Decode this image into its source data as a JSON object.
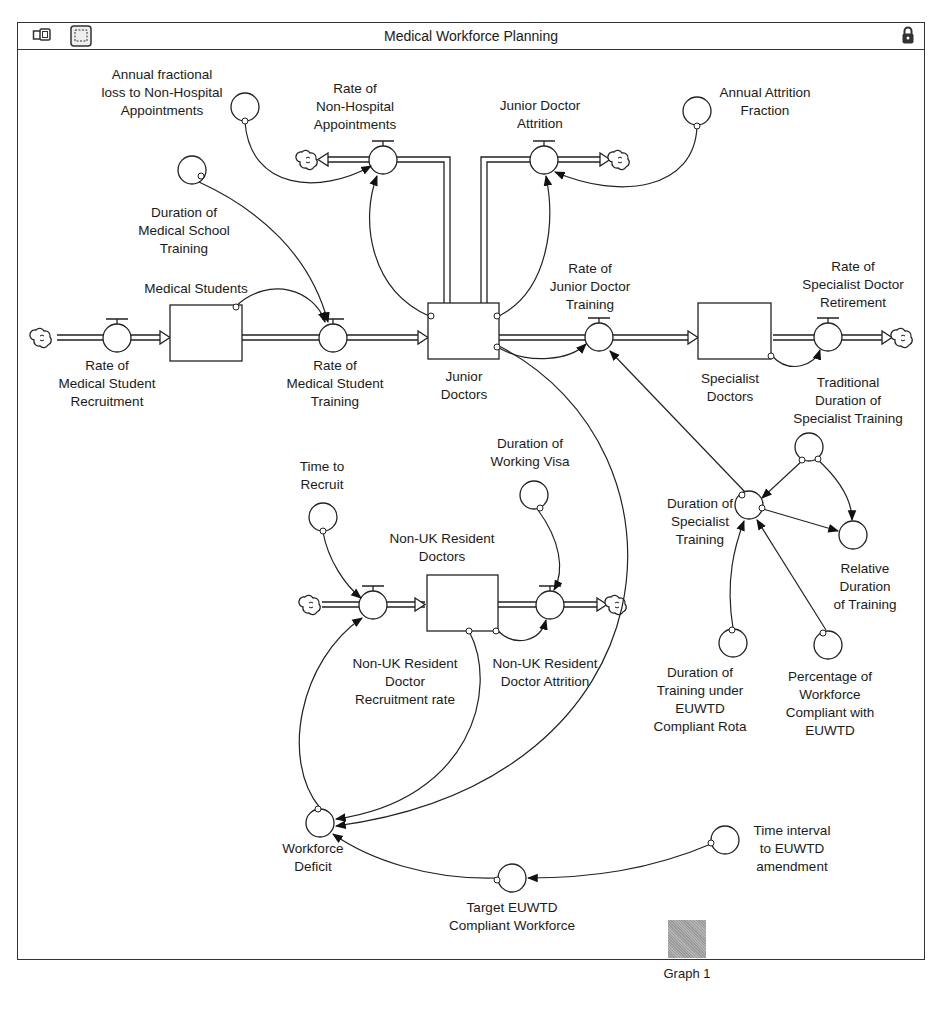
{
  "window": {
    "title": "Medical Workforce Planning",
    "icons": [
      "layers-icon",
      "selection-icon",
      "lock-icon"
    ]
  },
  "stocks": {
    "medical_students": "Medical Students",
    "junior_doctors": "Junior\nDoctors",
    "specialist_doctors": "Specialist\nDoctors",
    "non_uk_doctors": "Non-UK Resident\nDoctors"
  },
  "flows": {
    "med_student_recruitment": "Rate of\nMedical Student\nRecruitment",
    "med_student_training": "Rate of\nMedical Student\nTraining",
    "non_hospital_appointments": "Rate of\nNon-Hospital\nAppointments",
    "junior_attrition": "Junior Doctor\nAttrition",
    "junior_training": "Rate of\nJunior Doctor\nTraining",
    "specialist_retirement": "Rate of\nSpecialist Doctor\nRetirement",
    "non_uk_recruitment": "Non-UK Resident\nDoctor\nRecruitment rate",
    "non_uk_attrition": "Non-UK Resident\nDoctor Attrition"
  },
  "converters": {
    "annual_loss_non_hospital": "Annual fractional\nloss to Non-Hospital\nAppointments",
    "annual_attrition_fraction": "Annual Attrition\nFraction",
    "duration_med_school": "Duration of\nMedical School\nTraining",
    "traditional_duration": "Traditional\nDuration of\nSpecialist Training",
    "duration_specialist": "Duration of\nSpecialist\nTraining",
    "relative_duration": "Relative\nDuration\nof Training",
    "duration_euwtd_rota": "Duration of\nTraining under\nEUWTD\nCompliant Rota",
    "percentage_compliant": "Percentage of\nWorkforce\nCompliant with\nEUWTD",
    "time_to_recruit": "Time to\nRecruit",
    "duration_working_visa": "Duration of\nWorking Visa",
    "workforce_deficit": "Workforce\nDeficit",
    "target_workforce": "Target EUWTD\nCompliant Workforce",
    "time_interval_amendment": "Time interval\nto EUWTD\namendment"
  },
  "graph_pad": {
    "label": "Graph 1"
  }
}
